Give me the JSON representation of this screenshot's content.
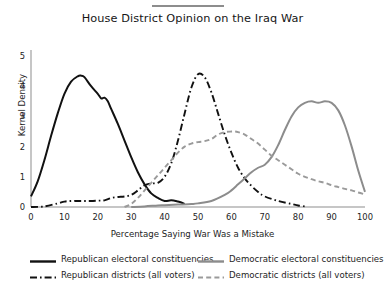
{
  "chart_data": {
    "type": "line",
    "title": "House District Opinion on the Iraq War",
    "xlabel": "Percentage Saying War Was a Mistake",
    "ylabel": "Kernel Density",
    "xlim": [
      0,
      100
    ],
    "ylim": [
      0,
      5.2
    ],
    "xticks": [
      0,
      10,
      20,
      30,
      40,
      50,
      60,
      70,
      80,
      90,
      100
    ],
    "yticks": [
      0,
      1,
      2,
      3,
      4,
      5
    ],
    "grid": false,
    "legend_position": "below",
    "series": [
      {
        "name": "Republican electoral constituencies",
        "color": "#111111",
        "style": "solid",
        "x": [
          0,
          2,
          4,
          6,
          8,
          10,
          12,
          14,
          15,
          16,
          18,
          20,
          21,
          22,
          23,
          24,
          26,
          28,
          30,
          32,
          34,
          36,
          38,
          40,
          42,
          44,
          45,
          46
        ],
        "y": [
          0.35,
          0.85,
          1.55,
          2.35,
          3.1,
          3.75,
          4.15,
          4.33,
          4.35,
          4.3,
          4.0,
          3.75,
          3.6,
          3.62,
          3.5,
          3.25,
          2.75,
          2.2,
          1.65,
          1.15,
          0.75,
          0.45,
          0.3,
          0.2,
          0.22,
          0.18,
          0.15,
          0.1
        ]
      },
      {
        "name": "Republican districts (all voters)",
        "color": "#111111",
        "style": "dashdot",
        "x": [
          0,
          4,
          8,
          10,
          12,
          14,
          16,
          18,
          20,
          22,
          24,
          26,
          28,
          30,
          32,
          34,
          36,
          38,
          40,
          42,
          44,
          46,
          48,
          50,
          52,
          54,
          56,
          58,
          60,
          62,
          64,
          66,
          68,
          70,
          74,
          78,
          80,
          82
        ],
        "y": [
          0.0,
          0.02,
          0.12,
          0.18,
          0.2,
          0.2,
          0.2,
          0.2,
          0.21,
          0.22,
          0.3,
          0.33,
          0.35,
          0.4,
          0.55,
          0.72,
          0.78,
          0.8,
          1.0,
          1.45,
          2.2,
          3.1,
          3.95,
          4.4,
          4.3,
          3.8,
          3.1,
          2.4,
          1.8,
          1.3,
          0.95,
          0.7,
          0.5,
          0.35,
          0.2,
          0.1,
          0.05,
          0.02
        ]
      },
      {
        "name": "Democratic electoral constituencies",
        "color": "#8c8c8c",
        "style": "solid",
        "x": [
          30,
          34,
          38,
          40,
          44,
          48,
          50,
          54,
          58,
          60,
          62,
          64,
          66,
          68,
          70,
          72,
          74,
          76,
          78,
          80,
          82,
          84,
          86,
          88,
          90,
          92,
          94,
          96,
          98,
          100
        ],
        "y": [
          0.0,
          0.02,
          0.05,
          0.06,
          0.08,
          0.1,
          0.12,
          0.2,
          0.4,
          0.55,
          0.75,
          0.95,
          1.15,
          1.3,
          1.4,
          1.65,
          2.05,
          2.55,
          3.0,
          3.3,
          3.45,
          3.5,
          3.45,
          3.5,
          3.45,
          3.2,
          2.7,
          2.0,
          1.2,
          0.5
        ]
      },
      {
        "name": "Democratic districts (all voters)",
        "color": "#9a9a9a",
        "style": "dashed",
        "x": [
          28,
          30,
          32,
          34,
          36,
          38,
          40,
          42,
          44,
          46,
          48,
          50,
          52,
          54,
          56,
          58,
          60,
          61,
          62,
          64,
          66,
          68,
          70,
          72,
          74,
          76,
          78,
          80,
          82,
          84,
          86,
          88,
          90,
          92,
          94,
          96,
          98,
          100
        ],
        "y": [
          0.0,
          0.1,
          0.3,
          0.55,
          0.8,
          1.05,
          1.3,
          1.55,
          1.8,
          2.0,
          2.1,
          2.15,
          2.18,
          2.25,
          2.4,
          2.48,
          2.5,
          2.5,
          2.48,
          2.4,
          2.25,
          2.1,
          1.9,
          1.7,
          1.55,
          1.4,
          1.25,
          1.1,
          1.0,
          0.92,
          0.85,
          0.8,
          0.72,
          0.66,
          0.6,
          0.55,
          0.48,
          0.42
        ]
      }
    ],
    "legend": [
      {
        "label": "Republican electoral constituencies",
        "color": "#111111",
        "style": "solid"
      },
      {
        "label": "Democratic electoral constituencies",
        "color": "#8c8c8c",
        "style": "solid"
      },
      {
        "label": "Republican districts (all voters)",
        "color": "#111111",
        "style": "dashdot"
      },
      {
        "label": "Democratic districts (all voters)",
        "color": "#9a9a9a",
        "style": "dashed"
      }
    ]
  }
}
